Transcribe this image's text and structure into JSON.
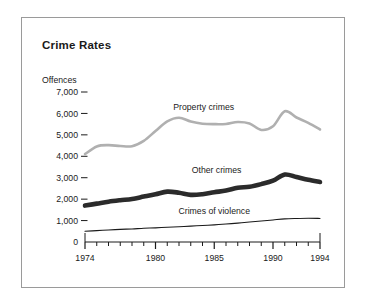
{
  "figure": {
    "border_color": "#9a9a9a",
    "background": "#ffffff"
  },
  "chart_data": {
    "type": "line",
    "title": "Crime Rates",
    "ylabel": "Offences",
    "xlabel": "",
    "xlim": [
      1974,
      1994
    ],
    "ylim": [
      0,
      7000
    ],
    "grid": false,
    "legend_position": "inline-labels",
    "y_ticks": [
      "0",
      "1,000",
      "2,000",
      "3,000",
      "4,000",
      "5,000",
      "6,000",
      "7,000"
    ],
    "y_tick_values": [
      0,
      1000,
      2000,
      3000,
      4000,
      5000,
      6000,
      7000
    ],
    "x_ticks": [
      "1974",
      "1980",
      "1985",
      "1990",
      "1994"
    ],
    "x_tick_values": [
      1974,
      1980,
      1985,
      1990,
      1994
    ],
    "x_minor_ticks": [
      1975,
      1976,
      1977,
      1978,
      1979,
      1981,
      1982,
      1983,
      1984,
      1986,
      1987,
      1988,
      1989,
      1991,
      1992,
      1993
    ],
    "x": [
      1974,
      1975,
      1976,
      1977,
      1978,
      1979,
      1980,
      1981,
      1982,
      1983,
      1984,
      1985,
      1986,
      1987,
      1988,
      1989,
      1990,
      1991,
      1992,
      1993,
      1994
    ],
    "series": [
      {
        "name": "Property crimes",
        "color": "#b0b0b0",
        "width": 2.6,
        "label_x": 1984.1,
        "label_y": 6180,
        "values": [
          4100,
          4460,
          4520,
          4480,
          4470,
          4720,
          5180,
          5630,
          5800,
          5620,
          5520,
          5500,
          5510,
          5600,
          5530,
          5230,
          5400,
          6100,
          5810,
          5560,
          5250
        ]
      },
      {
        "name": "Other crimes",
        "color": "#2b2b2b",
        "width": 4.6,
        "label_x": 1985.2,
        "label_y": 3220,
        "values": [
          1700,
          1790,
          1880,
          1950,
          2010,
          2120,
          2230,
          2350,
          2300,
          2200,
          2230,
          2320,
          2400,
          2530,
          2580,
          2700,
          2860,
          3150,
          3030,
          2900,
          2800
        ]
      },
      {
        "name": "Crimes of violence",
        "color": "#1a1a1a",
        "width": 1.1,
        "label_x": 1985.0,
        "label_y": 1290,
        "values": [
          500,
          530,
          560,
          590,
          610,
          640,
          660,
          690,
          710,
          740,
          770,
          800,
          840,
          880,
          930,
          980,
          1030,
          1080,
          1100,
          1110,
          1100
        ]
      }
    ]
  }
}
